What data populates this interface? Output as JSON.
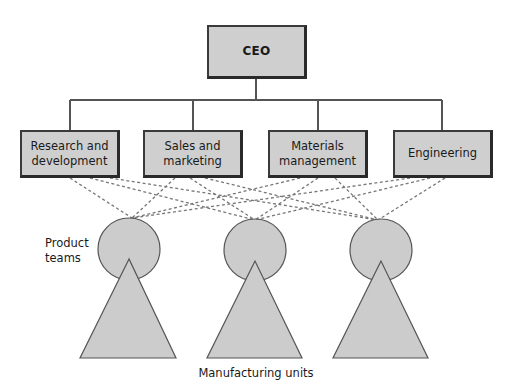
{
  "diagram": {
    "type": "organization-chart",
    "top": {
      "label": "CEO"
    },
    "departments": [
      {
        "label": "Research and\ndevelopment"
      },
      {
        "label": "Sales and\nmarketing"
      },
      {
        "label": "Materials\nmanagement"
      },
      {
        "label": "Engineering"
      }
    ],
    "product_teams_label": "Product\nteams",
    "manufacturing_units_label": "Manufacturing units",
    "product_team_count": 3,
    "connections": "each department linked by dashed lines to every product team",
    "colors": {
      "box_fill": "#cfcfcf",
      "box_border": "#2f2f2f",
      "shape_fill": "#cccccc",
      "line": "#555555",
      "dashed_line": "#777777"
    }
  }
}
